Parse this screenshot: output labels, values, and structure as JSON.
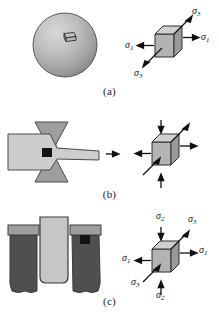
{
  "figure": {
    "type": "technical-illustration",
    "stress_symbol": "σ",
    "panels": [
      {
        "id": "a",
        "caption": "(a)",
        "specimen": {
          "name": "sphere-specimen",
          "shape": "sphere",
          "description": "shaded sphere with small stress element on surface",
          "fill_light": "#c9c9c9",
          "fill_dark": "#8a8a8a",
          "outline": "#4a4a4a",
          "element_fill": "#bdbdbd"
        },
        "element": {
          "name": "stress-cube-a",
          "stress_state": "biaxial",
          "faces": {
            "front": "#b3b3b3",
            "top": "#cfcfcf",
            "right": "#9a9a9a"
          },
          "labels": [
            {
              "symbol": "σ",
              "sub": "1",
              "position": "left",
              "direction": "outward"
            },
            {
              "symbol": "σ",
              "sub": "1",
              "position": "right",
              "direction": "outward"
            },
            {
              "symbol": "σ",
              "sub": "3",
              "position": "upper-right",
              "direction": "outward"
            },
            {
              "symbol": "σ",
              "sub": "3",
              "position": "lower-left",
              "direction": "outward"
            }
          ]
        }
      },
      {
        "id": "b",
        "caption": "(b)",
        "specimen": {
          "name": "necked-tensile-specimen",
          "shape": "necked-bar",
          "description": "fractured tensile bar with necked region and small black element at neck",
          "fill_light": "#cdcdcd",
          "fill_dark": "#9b9b9b",
          "outline": "#4a4a4a",
          "element_fill": "#141414"
        },
        "transfer_arrow": {
          "name": "transfer-arrow-b",
          "direction": "right"
        },
        "element": {
          "name": "stress-cube-b",
          "stress_state": "triaxial",
          "faces": {
            "front": "#b3b3b3",
            "top": "#cfcfcf",
            "right": "#9a9a9a"
          },
          "labels": [
            {
              "symbol": "σ",
              "sub": "1",
              "position": "left",
              "direction": "outward"
            },
            {
              "symbol": "σ",
              "sub": "1",
              "position": "right",
              "direction": "outward"
            },
            {
              "symbol": "σ",
              "sub": "2",
              "position": "top",
              "direction": "inward"
            },
            {
              "symbol": "σ",
              "sub": "2",
              "position": "bottom",
              "direction": "inward"
            },
            {
              "symbol": "σ",
              "sub": "3",
              "position": "upper-right",
              "direction": "outward"
            },
            {
              "symbol": "σ",
              "sub": "3",
              "position": "lower-left",
              "direction": "inward"
            }
          ]
        }
      },
      {
        "id": "c",
        "caption": "(c)",
        "specimen": {
          "name": "indentation-specimen",
          "shape": "punch-and-die",
          "description": "punch pressing into split block, small black element at corner",
          "fill_light": "#c6c6c6",
          "fill_mid": "#9e9e9e",
          "fill_dark": "#4f4f4f",
          "outline": "#3c3c3c",
          "element_fill": "#141414"
        },
        "element": {
          "name": "stress-cube-c",
          "stress_state": "triaxial",
          "faces": {
            "front": "#b3b3b3",
            "top": "#cfcfcf",
            "right": "#9a9a9a"
          },
          "labels": [
            {
              "symbol": "σ",
              "sub": "1",
              "position": "left",
              "direction": "outward"
            },
            {
              "symbol": "σ",
              "sub": "1",
              "position": "right",
              "direction": "outward"
            },
            {
              "symbol": "σ",
              "sub": "2",
              "position": "top",
              "direction": "inward"
            },
            {
              "symbol": "σ",
              "sub": "2",
              "position": "bottom",
              "direction": "inward"
            },
            {
              "symbol": "σ",
              "sub": "3",
              "position": "upper-right",
              "direction": "outward"
            },
            {
              "symbol": "σ",
              "sub": "3",
              "position": "lower-left",
              "direction": "inward"
            }
          ]
        }
      }
    ]
  }
}
